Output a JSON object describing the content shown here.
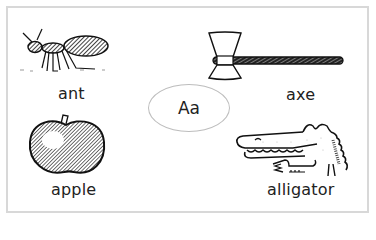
{
  "card": {
    "center_label": "Aa",
    "items": [
      {
        "word": "ant",
        "icon": "ant-icon"
      },
      {
        "word": "axe",
        "icon": "axe-icon"
      },
      {
        "word": "apple",
        "icon": "apple-icon"
      },
      {
        "word": "alligator",
        "icon": "alligator-icon"
      }
    ]
  },
  "colors": {
    "ink": "#222222",
    "frame": "#d8d8d8",
    "oval": "#bdbdbd",
    "background": "#ffffff"
  }
}
